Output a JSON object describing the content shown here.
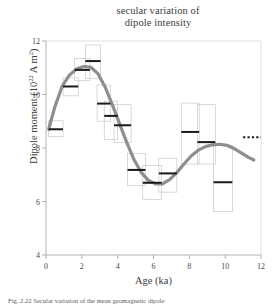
{
  "figure": {
    "title_line1": "secular variation of",
    "title_line2": "dipole intensity",
    "caption": "Fig. 2.22  Secular variation of the mean geomagnetic dipole"
  },
  "axes": {
    "xlabel": "Age (ka)",
    "ylabel_main": "Dipole moment  (10",
    "ylabel_sup": "22",
    "ylabel_tail": " A m",
    "ylabel_sup2": "2",
    "ylabel_close": ")",
    "x_ticks": [
      "0",
      "2",
      "4",
      "6",
      "8",
      "10",
      "12"
    ],
    "y_ticks": [
      "12",
      "10",
      "8",
      "6",
      "4"
    ]
  },
  "chart_data": {
    "type": "line",
    "title": "secular variation of dipole intensity",
    "xlabel": "Age (ka)",
    "ylabel": "Dipole moment (10^22 A m^2)",
    "xlim": [
      0,
      12
    ],
    "ylim": [
      4,
      12
    ],
    "x_ticks": [
      0,
      2,
      4,
      6,
      8,
      10,
      12
    ],
    "y_ticks": [
      4,
      6,
      8,
      10,
      12
    ],
    "grid": false,
    "legend": "none",
    "series": [
      {
        "name": "binned medians (black bars)",
        "type": "bar-markers",
        "points": [
          {
            "x_start": 0.15,
            "x_end": 0.95,
            "median": 8.7,
            "box_low": 8.42,
            "box_high": 9.02
          },
          {
            "x_start": 0.95,
            "x_end": 1.8,
            "median": 10.3,
            "box_low": 9.95,
            "box_high": 10.62
          },
          {
            "x_start": 1.6,
            "x_end": 2.45,
            "median": 10.92,
            "box_low": 10.52,
            "box_high": 11.35
          },
          {
            "x_start": 2.2,
            "x_end": 3.05,
            "median": 11.25,
            "box_low": 10.6,
            "box_high": 11.85
          },
          {
            "x_start": 2.85,
            "x_end": 3.6,
            "median": 9.66,
            "box_low": 9.0,
            "box_high": 10.35
          },
          {
            "x_start": 3.25,
            "x_end": 4.0,
            "median": 9.2,
            "box_low": 8.32,
            "box_high": 9.75
          },
          {
            "x_start": 3.8,
            "x_end": 4.75,
            "median": 8.85,
            "box_low": 8.2,
            "box_high": 9.62
          },
          {
            "x_start": 4.55,
            "x_end": 5.55,
            "median": 7.18,
            "box_low": 6.6,
            "box_high": 7.8
          },
          {
            "x_start": 5.4,
            "x_end": 6.45,
            "median": 6.7,
            "box_low": 6.08,
            "box_high": 7.35
          },
          {
            "x_start": 6.3,
            "x_end": 7.3,
            "median": 7.05,
            "box_low": 6.35,
            "box_high": 7.62
          },
          {
            "x_start": 7.55,
            "x_end": 8.55,
            "median": 8.6,
            "box_low": 7.4,
            "box_high": 9.68
          },
          {
            "x_start": 8.45,
            "x_end": 9.45,
            "median": 8.22,
            "box_low": 7.4,
            "box_high": 9.62
          },
          {
            "x_start": 9.35,
            "x_end": 10.4,
            "median": 6.72,
            "box_low": 5.62,
            "box_high": 8.1
          }
        ]
      },
      {
        "name": "smoothed dipole moment curve",
        "type": "line",
        "color": "#8e8e8e",
        "x": [
          0.15,
          0.5,
          0.9,
          1.3,
          1.7,
          2.1,
          2.5,
          2.9,
          3.3,
          3.7,
          4.1,
          4.5,
          4.9,
          5.3,
          5.7,
          6.1,
          6.5,
          6.9,
          7.3,
          7.7,
          8.1,
          8.5,
          8.9,
          9.3,
          9.7,
          10.1,
          10.5,
          10.9,
          11.3,
          11.6
        ],
        "y": [
          8.7,
          9.55,
          10.3,
          10.72,
          10.95,
          11.05,
          11.02,
          10.78,
          10.28,
          9.62,
          8.92,
          8.22,
          7.58,
          7.1,
          6.8,
          6.66,
          6.66,
          6.82,
          7.08,
          7.4,
          7.7,
          7.92,
          8.05,
          8.12,
          8.14,
          8.1,
          7.98,
          7.82,
          7.65,
          7.55
        ]
      },
      {
        "name": "present-day reference (dotted)",
        "type": "dotted-segment",
        "x_start": 11.0,
        "x_end": 12.0,
        "y": 8.4
      }
    ]
  },
  "colors": {
    "curve": "#8e8e8e",
    "median_bar": "#1a1a1a",
    "box_outline": "#c9c9c9",
    "axis": "#b0b0b0",
    "text": "#3c3c3c"
  }
}
